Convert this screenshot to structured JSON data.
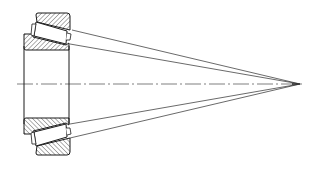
{
  "diagram": {
    "colors": {
      "background": "#ffffff",
      "line": "#2a2a2a",
      "hatch": "#3a3a3a"
    },
    "centerline": {
      "x1": 17,
      "y1": 84,
      "x2": 305,
      "y2": 84,
      "style": "dash-dot"
    },
    "apex": {
      "x": 300,
      "y": 84
    },
    "bore_lines": [
      {
        "x": 24,
        "y1": 46,
        "y2": 124
      },
      {
        "x": 69,
        "y1": 46,
        "y2": 124
      }
    ],
    "cone_lines": [
      {
        "x1": 72,
        "y1": 30,
        "x2": 300,
        "y2": 84
      },
      {
        "x1": 70,
        "y1": 44,
        "x2": 300,
        "y2": 84
      },
      {
        "x1": 70,
        "y1": 124,
        "x2": 300,
        "y2": 84
      },
      {
        "x1": 70,
        "y1": 138,
        "x2": 300,
        "y2": 84
      }
    ]
  }
}
